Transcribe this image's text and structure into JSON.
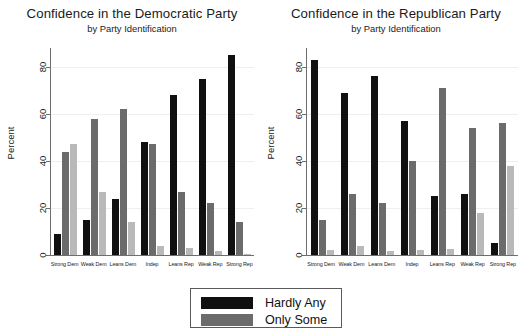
{
  "charts": [
    {
      "title": "Confidence in the Democratic Party",
      "subtitle": "by Party Identification",
      "ylabel": "Percent"
    },
    {
      "title": "Confidence in the Republican Party",
      "subtitle": "by Party Identification",
      "ylabel": "Percent"
    }
  ],
  "legend": {
    "items": [
      {
        "label": "Hardly Any",
        "color": "#101010"
      },
      {
        "label": "Only Some",
        "color": "#6b6b6b"
      }
    ]
  },
  "chart_data": [
    {
      "type": "bar",
      "title": "Confidence in the Democratic Party",
      "subtitle": "by Party Identification",
      "xlabel": "",
      "ylabel": "Percent",
      "ylim": [
        0,
        88
      ],
      "yticks": [
        0,
        20,
        40,
        60,
        80
      ],
      "grid": true,
      "legend_position": "bottom-center",
      "categories": [
        "Strong Dem",
        "Weak Dem",
        "Leans Dem",
        "Indep",
        "Leans Rep",
        "Weak Rep",
        "Strong Rep"
      ],
      "series": [
        {
          "name": "Hardly Any",
          "color": "#101010",
          "values": [
            9,
            15,
            24,
            48,
            68,
            75,
            85
          ]
        },
        {
          "name": "Only Some",
          "color": "#6b6b6b",
          "values": [
            44,
            58,
            62,
            47,
            27,
            22,
            14
          ]
        },
        {
          "name": "A Great Deal",
          "color": "#b9b9b9",
          "values": [
            47,
            27,
            14,
            4,
            3,
            1.5,
            0.5
          ]
        }
      ]
    },
    {
      "type": "bar",
      "title": "Confidence in the Republican Party",
      "subtitle": "by Party Identification",
      "xlabel": "",
      "ylabel": "Percent",
      "ylim": [
        0,
        88
      ],
      "yticks": [
        0,
        20,
        40,
        60,
        80
      ],
      "grid": true,
      "legend_position": "bottom-center",
      "categories": [
        "Strong Dem",
        "Weak Dem",
        "Leans Dem",
        "Indep",
        "Leans Rep",
        "Weak Rep",
        "Strong Rep"
      ],
      "series": [
        {
          "name": "Hardly Any",
          "color": "#101010",
          "values": [
            83,
            69,
            76,
            57,
            25,
            26,
            5
          ]
        },
        {
          "name": "Only Some",
          "color": "#6b6b6b",
          "values": [
            15,
            26,
            22,
            40,
            71,
            54,
            56
          ]
        },
        {
          "name": "A Great Deal",
          "color": "#b9b9b9",
          "values": [
            2,
            4,
            1.5,
            2,
            2.5,
            18,
            38
          ]
        }
      ]
    }
  ]
}
